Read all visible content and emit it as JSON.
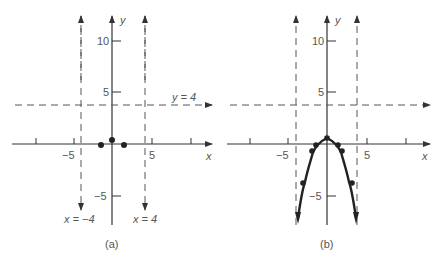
{
  "figure": {
    "panels": [
      {
        "id": "a",
        "caption": "(a)",
        "x_axis_label": "x",
        "y_axis_label": "y",
        "x_tick_labels": [
          "−5",
          "5"
        ],
        "y_tick_labels": [
          "10",
          "5",
          "−5"
        ],
        "asymptote_labels": {
          "horizontal": "y = 4",
          "vertical_left": "x = −4",
          "vertical_right": "x = 4"
        },
        "points": [
          [
            -1.4,
            0
          ],
          [
            0,
            0.6
          ],
          [
            1.4,
            0
          ]
        ]
      },
      {
        "id": "b",
        "caption": "(b)",
        "x_axis_label": "x",
        "y_axis_label": "y",
        "x_tick_labels": [
          "−5",
          "5"
        ],
        "y_tick_labels": [
          "10",
          "5",
          "−5"
        ],
        "points": [
          [
            -3.3,
            -3
          ],
          [
            -2,
            -0.8
          ],
          [
            -1.4,
            0
          ],
          [
            0,
            0.6
          ],
          [
            1.4,
            0
          ],
          [
            2,
            -0.8
          ],
          [
            3.3,
            -3
          ]
        ]
      }
    ],
    "colors": {
      "axis": "#333333",
      "dashed": "#555555",
      "curve": "#222222",
      "text": "#555555"
    }
  }
}
